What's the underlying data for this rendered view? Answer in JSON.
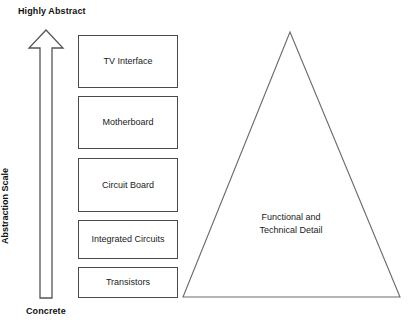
{
  "diagram": {
    "axis": {
      "top_label": "Highly Abstract",
      "bottom_label": "Concrete",
      "axis_title": "Abstraction Scale",
      "arrow_direction": "up"
    },
    "layers": [
      {
        "label": "TV Interface",
        "top": 35,
        "height": 53
      },
      {
        "label": "Motherboard",
        "top": 96,
        "height": 53
      },
      {
        "label": "Circuit Board",
        "top": 158,
        "height": 54
      },
      {
        "label": "Integrated Circuits",
        "top": 220,
        "height": 39
      },
      {
        "label": "Transistors",
        "top": 267,
        "height": 31
      }
    ],
    "triangle": {
      "label_line1": "Functional and",
      "label_line2": "Technical Detail",
      "apex_x": 290,
      "apex_y": 32,
      "base_left_x": 183,
      "base_right_x": 400,
      "base_y": 297
    },
    "colors": {
      "background": "#ffffff",
      "stroke": "#4a4a4a",
      "text": "#1a1a1a",
      "bold_text": "#111111"
    }
  }
}
